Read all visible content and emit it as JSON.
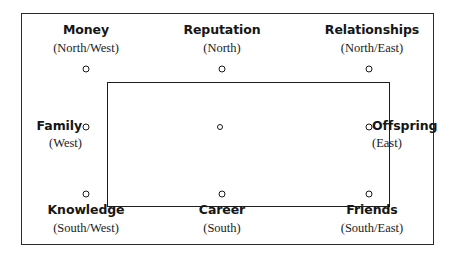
{
  "diagram": {
    "frame_color": "#2b2b2b",
    "square_color": "#1d1d1d",
    "node_color": "#1a1a1a",
    "background": "#ffffff",
    "center_node": "center-point",
    "nodes": [
      {
        "id": "money",
        "name": "Money",
        "direction": "(North/West)",
        "position": "top-left"
      },
      {
        "id": "reputation",
        "name": "Reputation",
        "direction": "(North)",
        "position": "top-center"
      },
      {
        "id": "relationships",
        "name": "Relationships",
        "direction": "(North/East)",
        "position": "top-right"
      },
      {
        "id": "family",
        "name": "Family",
        "direction": "(West)",
        "position": "middle-left"
      },
      {
        "id": "offspring",
        "name": "Offspring",
        "direction": "(East)",
        "position": "middle-right"
      },
      {
        "id": "knowledge",
        "name": "Knowledge",
        "direction": "(South/West)",
        "position": "bottom-left"
      },
      {
        "id": "career",
        "name": "Career",
        "direction": "(South)",
        "position": "bottom-center"
      },
      {
        "id": "friends",
        "name": "Friends",
        "direction": "(South/East)",
        "position": "bottom-right"
      }
    ]
  }
}
